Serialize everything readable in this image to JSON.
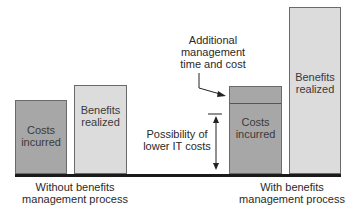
{
  "diagram": {
    "left_group": {
      "caption_line1": "Without benefits",
      "caption_line2": "management process",
      "costs_bar": {
        "line1": "Costs",
        "line2": "incurred"
      },
      "benefits_bar": {
        "line1": "Benefits",
        "line2": "realized"
      }
    },
    "right_group": {
      "caption_line1": "With benefits",
      "caption_line2": "management process",
      "costs_bar": {
        "line1": "Costs",
        "line2": "incurred"
      },
      "benefits_bar": {
        "line1": "Benefits",
        "line2": "realized"
      }
    },
    "annotations": {
      "additional": {
        "line1": "Additional",
        "line2": "management",
        "line3": "time and cost"
      },
      "possibility": {
        "line1": "Possibility of",
        "line2": "lower IT costs"
      }
    },
    "colors": {
      "costs_fill": "#a7a7a7",
      "benefits_fill": "#dcdcdc",
      "baseline": "#1a1a1a"
    }
  }
}
